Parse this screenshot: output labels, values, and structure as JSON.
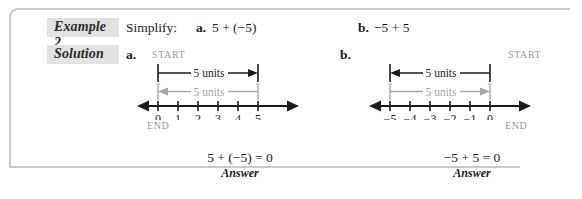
{
  "example": {
    "label": "Example 2",
    "instruction": "Simplify:",
    "parts": [
      {
        "letter": "a.",
        "expression": "5 + (−5)"
      },
      {
        "letter": "b.",
        "expression": "−5 + 5"
      }
    ]
  },
  "solution": {
    "label": "Solution",
    "parts": [
      {
        "letter": "a.",
        "start_label": "START",
        "end_label": "END",
        "black_arrow_label": "5 units",
        "gray_arrow_label": "5 units",
        "black_arrow_direction": "right",
        "gray_arrow_direction": "left",
        "equation": "5 + (−5) = 0",
        "answer_word": "Answer"
      },
      {
        "letter": "b.",
        "start_label": "START",
        "end_label": "END",
        "black_arrow_label": "5 units",
        "gray_arrow_label": "5 units",
        "black_arrow_direction": "left",
        "gray_arrow_direction": "right",
        "equation": "−5 + 5 = 0",
        "answer_word": "Answer"
      }
    ]
  },
  "numberlines": [
    {
      "id": "numberline-a",
      "ticks": [
        "0",
        "1",
        "2",
        "3",
        "4",
        "5"
      ],
      "min": 0,
      "max": 5
    },
    {
      "id": "numberline-b",
      "ticks": [
        "−5",
        "−4",
        "−3",
        "−2",
        "−1",
        "0"
      ],
      "min": -5,
      "max": 0
    }
  ],
  "colors": {
    "black": "#1a1a1a",
    "gray_arrow": "#a6a6a6",
    "chip_background": "#e2e2e2",
    "frame_border": "#c9c9c9",
    "muted_text": "#9a9a9a"
  }
}
